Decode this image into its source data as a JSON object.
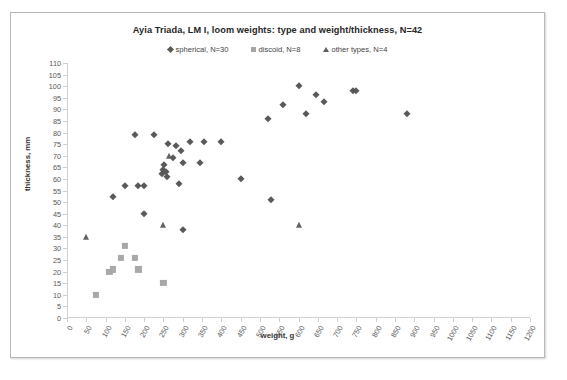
{
  "chart_data": {
    "type": "scatter",
    "title": "Ayia Triada, LM I, loom weights: type and weight/thickness, N=42",
    "xlabel": "weight, g",
    "ylabel": "thickness, mm",
    "xlim": [
      0,
      1200
    ],
    "ylim": [
      0,
      110
    ],
    "xticks": [
      0,
      50,
      100,
      150,
      200,
      250,
      300,
      350,
      400,
      450,
      500,
      550,
      600,
      650,
      700,
      750,
      800,
      850,
      900,
      950,
      1000,
      1050,
      1100,
      1150,
      1200
    ],
    "yticks": [
      0,
      5,
      10,
      15,
      20,
      25,
      30,
      35,
      40,
      45,
      50,
      55,
      60,
      65,
      70,
      75,
      80,
      85,
      90,
      95,
      100,
      105,
      110
    ],
    "grid": false,
    "legend_position": "top-center",
    "series": [
      {
        "name": "spherical, N=30",
        "marker": "diamond",
        "color": "#595959",
        "points": [
          [
            120,
            52
          ],
          [
            150,
            57
          ],
          [
            175,
            79
          ],
          [
            185,
            57
          ],
          [
            200,
            57
          ],
          [
            200,
            45
          ],
          [
            225,
            79
          ],
          [
            245,
            62
          ],
          [
            250,
            64
          ],
          [
            252,
            66
          ],
          [
            256,
            63
          ],
          [
            258,
            61
          ],
          [
            262,
            75
          ],
          [
            275,
            69
          ],
          [
            282,
            74
          ],
          [
            290,
            58
          ],
          [
            295,
            72
          ],
          [
            300,
            67
          ],
          [
            300,
            38
          ],
          [
            320,
            76
          ],
          [
            345,
            67
          ],
          [
            355,
            76
          ],
          [
            400,
            76
          ],
          [
            450,
            60
          ],
          [
            520,
            86
          ],
          [
            530,
            51
          ],
          [
            560,
            92
          ],
          [
            600,
            100
          ],
          [
            620,
            88
          ],
          [
            645,
            96
          ],
          [
            665,
            93
          ],
          [
            740,
            98
          ],
          [
            750,
            98
          ],
          [
            880,
            88
          ]
        ]
      },
      {
        "name": "discoid, N=8",
        "marker": "square",
        "color": "#a8a8a8",
        "points": [
          [
            75,
            10
          ],
          [
            110,
            20
          ],
          [
            120,
            21
          ],
          [
            140,
            26
          ],
          [
            150,
            31
          ],
          [
            175,
            26
          ],
          [
            185,
            21
          ],
          [
            250,
            15
          ]
        ]
      },
      {
        "name": "other types, N=4",
        "marker": "triangle",
        "color": "#636363",
        "points": [
          [
            50,
            35
          ],
          [
            250,
            40
          ],
          [
            265,
            70
          ],
          [
            600,
            40
          ]
        ]
      }
    ]
  },
  "legend": [
    {
      "label": "spherical, N=30",
      "marker": "diamond-icon"
    },
    {
      "label": "discoid, N=8",
      "marker": "square-icon"
    },
    {
      "label": "other types, N=4",
      "marker": "triangle-icon"
    }
  ]
}
